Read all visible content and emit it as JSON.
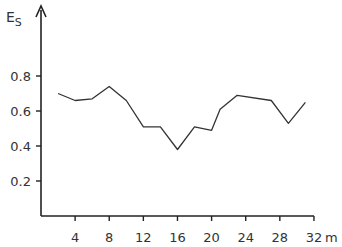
{
  "chart_data": {
    "type": "line",
    "title": "",
    "xlabel": "m",
    "ylabel": "E_S",
    "ylabel_main": "E",
    "ylabel_sub": "S",
    "xlim": [
      0,
      32
    ],
    "ylim": [
      0,
      1.0
    ],
    "x_ticks": [
      4,
      8,
      12,
      16,
      20,
      24,
      28,
      32
    ],
    "x_tick_labels": [
      "4",
      "8",
      "12",
      "16",
      "20",
      "24",
      "28",
      "32"
    ],
    "y_ticks": [
      0.2,
      0.4,
      0.6,
      0.8
    ],
    "y_tick_labels": [
      "0.2",
      "0.4",
      "0.6",
      "0.8"
    ],
    "grid": false,
    "legend": null,
    "x": [
      2,
      4,
      6,
      8,
      10,
      12,
      14,
      16,
      18,
      20,
      21,
      23,
      27,
      29,
      31
    ],
    "series": [
      {
        "name": "E_S",
        "values": [
          0.7,
          0.66,
          0.67,
          0.74,
          0.66,
          0.51,
          0.51,
          0.38,
          0.51,
          0.49,
          0.61,
          0.69,
          0.66,
          0.53,
          0.65
        ]
      }
    ]
  }
}
